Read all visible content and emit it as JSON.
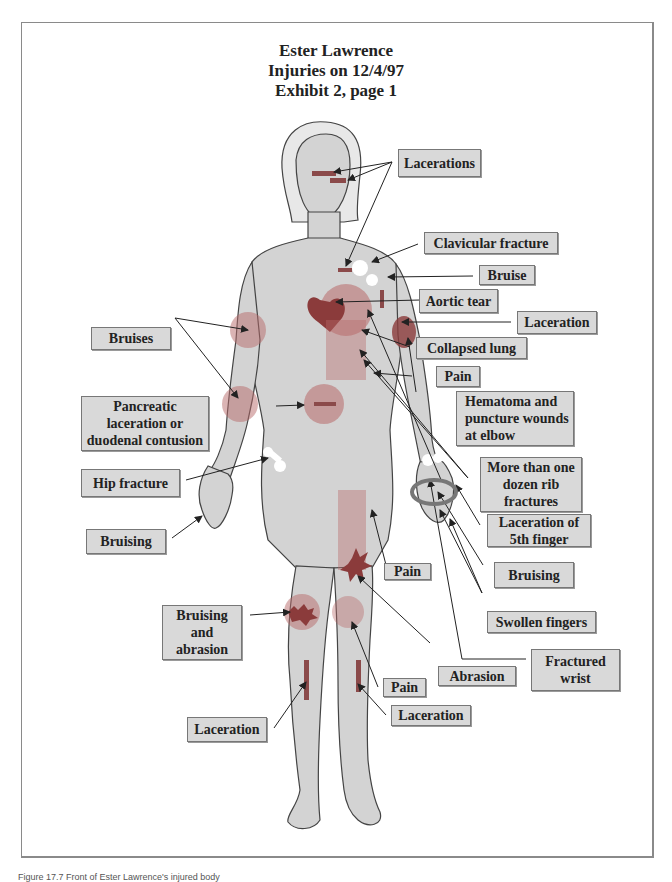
{
  "title": {
    "line1": "Ester Lawrence",
    "line2": "Injuries on 12/4/97",
    "line3": "Exhibit 2, page 1"
  },
  "labels": {
    "lacerations_head": "Lacerations",
    "clavicular_fracture": "Clavicular fracture",
    "bruise_shoulder": "Bruise",
    "aortic_tear": "Aortic tear",
    "laceration_arm": "Laceration",
    "collapsed_lung": "Collapsed lung",
    "pain_chest": "Pain",
    "hematoma": "Hematoma and\npuncture wounds\nat elbow",
    "rib_fractures": "More than one\ndozen rib\nfractures",
    "laceration_finger": "Laceration of\n5th finger",
    "bruising_left_hand": "Bruising",
    "swollen_fingers": "Swollen fingers",
    "fractured_wrist": "Fractured\nwrist",
    "bruises_right_arm": "Bruises",
    "pancreatic": "Pancreatic\nlaceration or\nduodenal contusion",
    "hip_fracture": "Hip fracture",
    "bruising_right_hand": "Bruising",
    "pain_abdomen": "Pain",
    "bruising_abrasion_knee": "Bruising\nand\nabrasion",
    "abrasion_thigh": "Abrasion",
    "pain_knee": "Pain",
    "laceration_right_shin": "Laceration",
    "laceration_left_shin": "Laceration"
  },
  "colors": {
    "label_bg": "#d9d9d9",
    "injury_red": "#b86a6a",
    "injury_dark": "#8b3b3b",
    "skin": "#d2d2d2"
  },
  "caption": "Figure 17.7 Front of Ester Lawrence's injured body"
}
